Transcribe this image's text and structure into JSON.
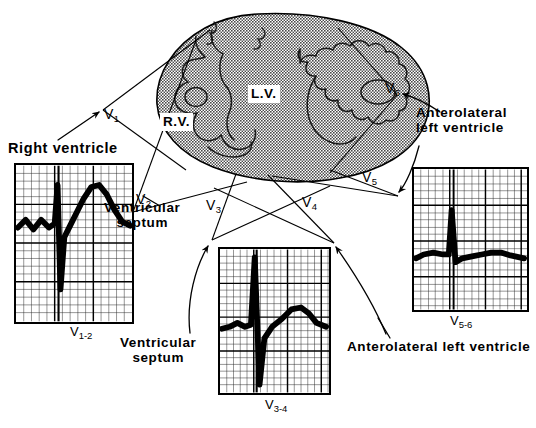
{
  "figure": {
    "kind": "anatomical-diagram"
  },
  "heart": {
    "label_right_ventricle": "R.V.",
    "label_left_ventricle": "L.V.",
    "fill_color": "#8c8c8c",
    "outline_color": "#000000"
  },
  "leads": [
    {
      "id": "v1",
      "text": "V",
      "sub": "1"
    },
    {
      "id": "v2",
      "text": "V",
      "sub": "2"
    },
    {
      "id": "v3",
      "text": "V",
      "sub": "3"
    },
    {
      "id": "v4",
      "text": "V",
      "sub": "4"
    },
    {
      "id": "v5",
      "text": "V",
      "sub": "5"
    },
    {
      "id": "v6",
      "text": "V",
      "sub": "6"
    }
  ],
  "annotations": {
    "right_ventricle": "Right ventricle",
    "ventricular_septum_upper": "Ventricular\nseptum",
    "ventricular_septum_upper_line1": "Ventricular",
    "ventricular_septum_upper_line2": "septum",
    "ventricular_septum_lower_line1": "Ventricular",
    "ventricular_septum_lower_line2": "septum",
    "anterolateral_upper_line1": "Anterolateral",
    "anterolateral_upper_line2": "left ventricle",
    "anterolateral_lower": "Anterolateral left ventricle"
  },
  "panels": [
    {
      "id": "v1-2",
      "caption_text": "V",
      "caption_sub": "1-2",
      "describes": "Right ventricle / right precordial complex",
      "grid": {
        "small_mm": 1,
        "bold_every": 5,
        "grid_color": "#000000"
      },
      "waveform": {
        "morphology": "small rS with prominent upright T",
        "r_wave": "small",
        "s_wave": "deep",
        "t_wave": "tall upright"
      }
    },
    {
      "id": "v3-4",
      "caption_text": "V",
      "caption_sub": "3-4",
      "describes": "Ventricular septum / transition zone complex",
      "grid": {
        "small_mm": 1,
        "bold_every": 5,
        "grid_color": "#000000"
      },
      "waveform": {
        "morphology": "tall R with deep S, rounded upright T",
        "r_wave": "tall",
        "s_wave": "deep",
        "t_wave": "upright rounded"
      }
    },
    {
      "id": "v5-6",
      "caption_text": "V",
      "caption_sub": "5-6",
      "describes": "Anterolateral left ventricle complex",
      "grid": {
        "small_mm": 1,
        "bold_every": 5,
        "grid_color": "#000000"
      },
      "waveform": {
        "morphology": "narrow tall R on flat baseline, low T",
        "r_wave": "tall narrow",
        "s_wave": "absent",
        "t_wave": "low upright"
      }
    }
  ]
}
